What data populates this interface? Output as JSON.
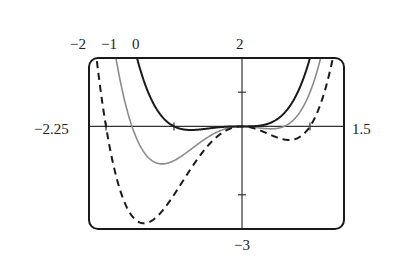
{
  "chart_data": {
    "type": "line",
    "title": "",
    "xlabel": "",
    "ylabel": "",
    "function": "f(x) = x^4 + x^3 + c*x^2",
    "xlim": [
      -2.25,
      1.5
    ],
    "ylim": [
      -3,
      2
    ],
    "grid": false,
    "legend": "none (curves labeled by parameter c above the frame)",
    "range_labels": {
      "xmin": "−2.25",
      "xmax": "1.5",
      "ymax": "2",
      "ymin": "−3"
    },
    "curve_labels": [
      "−2",
      "−1",
      "0"
    ],
    "x_ticks": [
      -2,
      -1,
      1
    ],
    "y_ticks": [
      -2,
      1
    ],
    "x": [
      -2.25,
      -2,
      -1.75,
      -1.5,
      -1.25,
      -1,
      -0.75,
      -0.5,
      -0.25,
      0,
      0.25,
      0.5,
      0.75,
      1,
      1.25,
      1.5
    ],
    "series": [
      {
        "name": "c = 0",
        "c": 0,
        "style": "solid",
        "color": "#1a1a1a",
        "values": [
          14.24,
          8,
          4.02,
          1.69,
          0.49,
          0,
          -0.11,
          -0.06,
          -0.01,
          0,
          0.02,
          0.19,
          0.74,
          2,
          4.39,
          8.44
        ]
      },
      {
        "name": "c = -1",
        "c": -1,
        "style": "solid-gray",
        "color": "#8c8c8c",
        "values": [
          9.18,
          4,
          0.96,
          -0.56,
          -1.07,
          -1,
          -0.67,
          -0.31,
          -0.07,
          0,
          -0.04,
          -0.06,
          0.18,
          1,
          2.83,
          6.19
        ]
      },
      {
        "name": "c = -2",
        "c": -2,
        "style": "dashed",
        "color": "#1a1a1a",
        "values": [
          4.12,
          0,
          -2.1,
          -2.81,
          -2.64,
          -2,
          -1.23,
          -0.56,
          -0.14,
          0,
          -0.11,
          -0.31,
          -0.39,
          0,
          1.27,
          3.94
        ]
      }
    ]
  },
  "frame": {
    "left": 89,
    "top": 58,
    "right": 344,
    "bottom": 229,
    "radius": 9
  }
}
